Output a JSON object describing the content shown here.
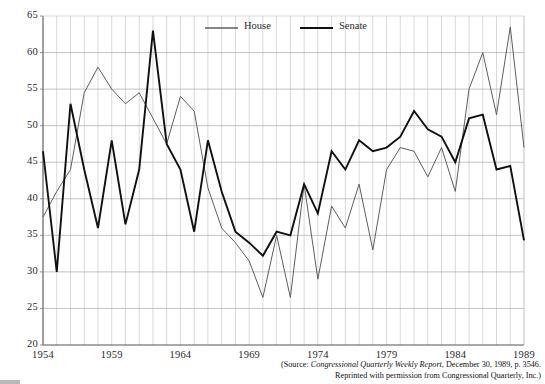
{
  "chart_data": {
    "type": "line",
    "title": "",
    "xlabel": "",
    "ylabel": "",
    "xlim": [
      1954,
      1989
    ],
    "ylim": [
      20,
      65
    ],
    "grid": true,
    "grid_x": true,
    "grid_y": true,
    "legend_position": "top-center",
    "y_ticks": [
      20,
      25,
      30,
      35,
      40,
      45,
      50,
      55,
      60,
      65
    ],
    "y_tick_labels": [
      "20",
      "25",
      "30",
      "35",
      "40",
      "45",
      "50",
      "55",
      "60",
      "65"
    ],
    "x_ticks": [
      1954,
      1959,
      1964,
      1969,
      1974,
      1979,
      1984,
      1989
    ],
    "x_tick_labels": [
      "1954",
      "1959",
      "1964",
      "1969",
      "1974",
      "1979",
      "1984",
      "1989"
    ],
    "x": [
      1954,
      1955,
      1956,
      1957,
      1958,
      1959,
      1960,
      1961,
      1962,
      1963,
      1964,
      1965,
      1966,
      1967,
      1968,
      1969,
      1970,
      1971,
      1972,
      1973,
      1974,
      1975,
      1976,
      1977,
      1978,
      1979,
      1980,
      1981,
      1982,
      1983,
      1984,
      1985,
      1986,
      1987,
      1988,
      1989
    ],
    "series": [
      {
        "name": "House",
        "color": "#5e5e5e",
        "width": 1.0,
        "values": [
          37.5,
          41.0,
          44.0,
          54.5,
          58.0,
          55.0,
          53.0,
          54.5,
          51.0,
          47.5,
          54.0,
          52.0,
          41.5,
          36.0,
          34.0,
          31.5,
          26.5,
          35.0,
          26.5,
          42.0,
          29.0,
          39.0,
          36.0,
          42.0,
          33.0,
          44.0,
          47.0,
          46.5,
          43.0,
          47.0,
          41.0,
          55.0,
          60.0,
          51.5,
          63.5,
          47.0
        ]
      },
      {
        "name": "Senate",
        "color": "#101010",
        "width": 1.9,
        "values": [
          46.5,
          30.0,
          53.0,
          44.0,
          36.0,
          48.0,
          36.5,
          44.0,
          63.0,
          47.5,
          44.0,
          35.5,
          48.0,
          41.0,
          35.5,
          34.0,
          32.2,
          35.5,
          35.0,
          42.0,
          38.0,
          46.5,
          44.0,
          48.0,
          46.5,
          47.0,
          48.5,
          52.0,
          49.5,
          48.5,
          45.0,
          51.0,
          51.5,
          44.0,
          44.5,
          34.3
        ]
      }
    ]
  },
  "legend": {
    "items": [
      {
        "label": "House"
      },
      {
        "label": "Senate"
      }
    ]
  },
  "source_note": {
    "line1_prefix": "(Source: ",
    "line1_italic": "Congressional Quarterly Weekly Report",
    "line1_suffix": ", December 30, 1989, p. 3546.",
    "line2": "Reprinted with permission from Congressional Quarterly, Inc.)"
  }
}
